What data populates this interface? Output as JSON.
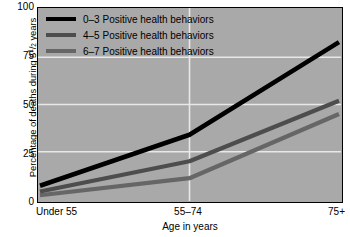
{
  "chart_data": {
    "type": "line",
    "title": "",
    "xlabel": "Age in years",
    "ylabel_prefix": "Percentage of deaths during 5",
    "ylabel_fraction_num": "1",
    "ylabel_fraction_den": "2",
    "ylabel_suffix": " years",
    "ylabel_plain": "Percentage of deaths during 5 1/2 years",
    "categories": [
      "Under 55",
      "55–74",
      "75+"
    ],
    "ylim": [
      0,
      100
    ],
    "yticks": [
      100,
      75,
      50,
      25,
      0
    ],
    "ytick_labels": [
      "100",
      "75",
      "50",
      "25",
      "0"
    ],
    "grid": true,
    "grid_color": "#e8e8e8",
    "plot_background": "#a9a9a9",
    "legend_position": "top-left",
    "series": [
      {
        "name": "0–3 Positive health behaviors",
        "color": "#000000",
        "values": [
          7,
          34,
          83
        ]
      },
      {
        "name": "4–5 Positive health behaviors",
        "color": "#4d4d4d",
        "values": [
          4,
          20,
          52
        ]
      },
      {
        "name": "6–7 Positive health behaviors",
        "color": "#666666",
        "values": [
          2,
          11,
          45
        ]
      }
    ]
  },
  "legend": {
    "items": [
      {
        "label": "0–3 Positive health behaviors",
        "color": "#000000"
      },
      {
        "label": "4–5 Positive health behaviors",
        "color": "#4d4d4d"
      },
      {
        "label": "6–7 Positive health behaviors",
        "color": "#666666"
      }
    ]
  },
  "axes": {
    "x_title": "Age in years",
    "x_tick_labels": [
      "Under 55",
      "55–74",
      "75+"
    ],
    "y_tick_labels": [
      "100",
      "75",
      "50",
      "25",
      "0"
    ]
  }
}
